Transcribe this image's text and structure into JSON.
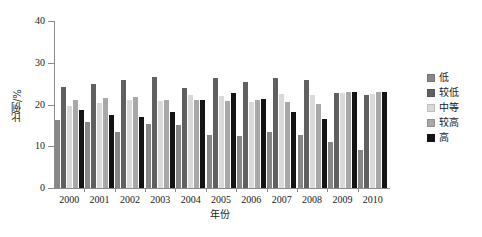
{
  "chart_data": {
    "type": "bar",
    "title": "",
    "xlabel": "年份",
    "ylabel": "比例/%",
    "ylim": [
      0,
      40
    ],
    "yticks": [
      0,
      10,
      20,
      30,
      40
    ],
    "grid": false,
    "legend_position": "right",
    "categories": [
      "2000",
      "2001",
      "2002",
      "2003",
      "2004",
      "2005",
      "2006",
      "2007",
      "2008",
      "2009",
      "2010"
    ],
    "series": [
      {
        "name": "低",
        "color": "#878787",
        "values": [
          16.2,
          15.8,
          13.3,
          15.3,
          15.2,
          12.6,
          12.4,
          13.5,
          12.8,
          11.1,
          9.0
        ]
      },
      {
        "name": "较低",
        "color": "#606060",
        "values": [
          24.2,
          25.0,
          25.8,
          26.6,
          23.9,
          26.4,
          25.4,
          26.3,
          25.8,
          22.7,
          22.3
        ]
      },
      {
        "name": "中等",
        "color": "#d9d9d9",
        "values": [
          19.7,
          20.3,
          21.0,
          20.9,
          22.3,
          22.0,
          20.6,
          22.5,
          22.2,
          22.8,
          22.4
        ]
      },
      {
        "name": "较高",
        "color": "#a8a8a8",
        "values": [
          21.0,
          21.6,
          21.9,
          21.1,
          21.2,
          20.8,
          21.2,
          20.5,
          20.2,
          23.0,
          23.0
        ]
      },
      {
        "name": "高",
        "color": "#141414",
        "values": [
          18.8,
          17.5,
          17.0,
          18.1,
          21.1,
          22.8,
          21.3,
          18.3,
          16.5,
          23.0,
          23.0
        ]
      }
    ]
  },
  "axis": {
    "y_title": "比例/%",
    "x_title": "年份"
  }
}
